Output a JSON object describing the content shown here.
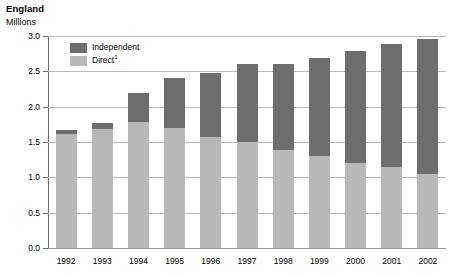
{
  "chart_data": {
    "type": "bar",
    "title": "England",
    "subtitle": "Millions",
    "xlabel": "",
    "ylabel": "Millions",
    "stacked": true,
    "grid": true,
    "legend_position": "inside-top-left",
    "ylim": [
      0.0,
      3.0
    ],
    "ytick_labels": [
      "0.0",
      "0.5",
      "1.0",
      "1.5",
      "2.0",
      "2.5",
      "3.0"
    ],
    "ytick_values": [
      0.0,
      0.5,
      1.0,
      1.5,
      2.0,
      2.5,
      3.0
    ],
    "categories": [
      "1992",
      "1993",
      "1994",
      "1995",
      "1996",
      "1997",
      "1998",
      "1999",
      "2000",
      "2001",
      "2002"
    ],
    "series": [
      {
        "name": "Direct",
        "legend_label": "Direct",
        "legend_footnote": "1",
        "color": "#b8b8b8",
        "values": [
          1.62,
          1.68,
          1.78,
          1.7,
          1.57,
          1.5,
          1.39,
          1.3,
          1.21,
          1.15,
          1.05
        ]
      },
      {
        "name": "Independent",
        "legend_label": "Independent",
        "legend_footnote": "",
        "color": "#6e6e6e",
        "values": [
          0.05,
          0.09,
          0.42,
          0.7,
          0.91,
          1.1,
          1.22,
          1.39,
          1.58,
          1.74,
          1.91
        ]
      }
    ],
    "totals": [
      1.67,
      1.77,
      2.2,
      2.4,
      2.48,
      2.6,
      2.61,
      2.69,
      2.79,
      2.89,
      2.96
    ]
  },
  "colors": {
    "independent": "#6e6e6e",
    "direct": "#b8b8b8",
    "gridline": "#b9b9b9",
    "axis": "#6b6b6b",
    "text": "#000000",
    "background": "#ffffff"
  }
}
